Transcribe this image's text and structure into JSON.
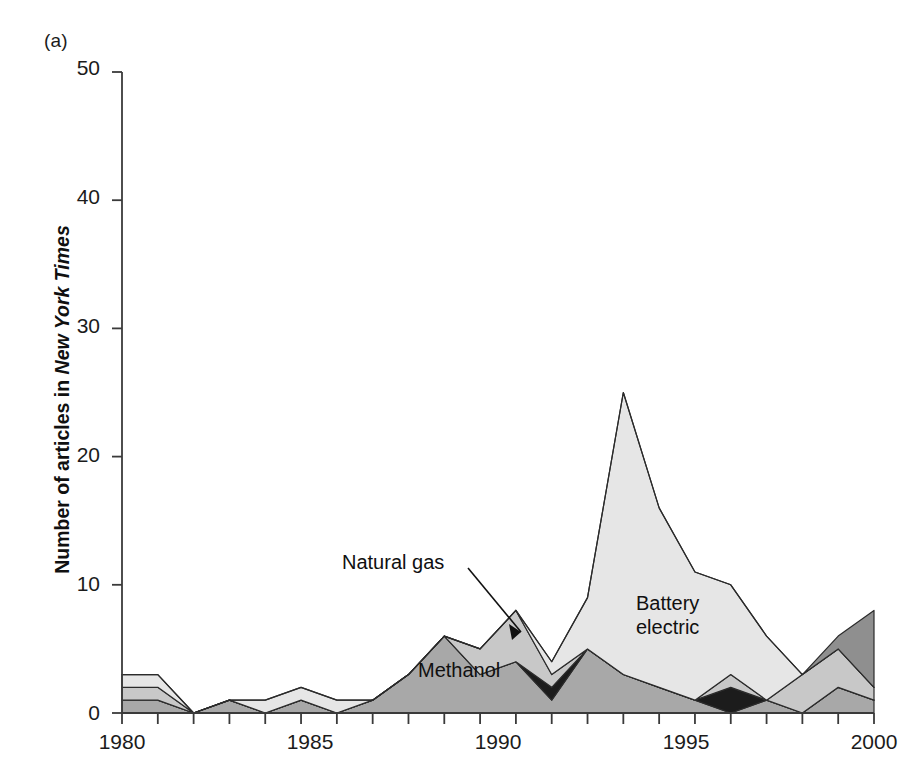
{
  "figure": {
    "panel_label": "(a)"
  },
  "axes": {
    "ylabel_prefix": "Number of articles in ",
    "ylabel_italic": "New York Times",
    "y_ticks": [
      "0",
      "10",
      "20",
      "30",
      "40",
      "50"
    ],
    "x_ticks": [
      "1980",
      "1985",
      "1990",
      "1995",
      "2000"
    ]
  },
  "annotations": {
    "natural_gas": "Natural gas",
    "battery_electric_line1": "Battery",
    "battery_electric_line2": "electric",
    "methanol": "Methanol"
  },
  "colors": {
    "methanol": "#a8a8a8",
    "hydrogen_dark": "#1c1c1c",
    "natural_gas": "#c8c8c8",
    "battery_electric": "#e6e6e6",
    "other_dark_gray": "#8f8f8f",
    "outline": "#2b2b2b",
    "axis": "#3a3a3a",
    "background": "#ffffff"
  },
  "chart_data": {
    "type": "area",
    "title": "",
    "subtitle": "",
    "xlabel": "",
    "ylabel": "Number of articles in New York Times",
    "xlim": [
      1980,
      2001
    ],
    "ylim": [
      0,
      50
    ],
    "grid": false,
    "stacked": true,
    "legend_position": "inline-annotations",
    "x": [
      1980,
      1981,
      1982,
      1983,
      1984,
      1985,
      1986,
      1987,
      1988,
      1989,
      1990,
      1991,
      1992,
      1993,
      1994,
      1995,
      1996,
      1997,
      1998,
      1999,
      2000,
      2001
    ],
    "categories": [
      "1980",
      "1981",
      "1982",
      "1983",
      "1984",
      "1985",
      "1986",
      "1987",
      "1988",
      "1989",
      "1990",
      "1991",
      "1992",
      "1993",
      "1994",
      "1995",
      "1996",
      "1997",
      "1998",
      "1999",
      "2000",
      "2001"
    ],
    "series": [
      {
        "name": "Methanol",
        "color": "#a8a8a8",
        "values": [
          1,
          1,
          0,
          1,
          0,
          1,
          0,
          1,
          3,
          6,
          3,
          4,
          1,
          5,
          3,
          2,
          1,
          0,
          1,
          0,
          2,
          1
        ]
      },
      {
        "name": "Hydrogen / fuel cell",
        "color": "#1c1c1c",
        "values": [
          0,
          0,
          0,
          0,
          0,
          0,
          0,
          0,
          0,
          0,
          0,
          0,
          1,
          0,
          0,
          0,
          0,
          2,
          0,
          0,
          0,
          0
        ]
      },
      {
        "name": "Natural gas",
        "color": "#c8c8c8",
        "values": [
          1,
          1,
          0,
          0,
          0,
          0,
          0,
          0,
          0,
          0,
          2,
          4,
          1,
          0,
          0,
          0,
          0,
          1,
          0,
          3,
          3,
          1
        ]
      },
      {
        "name": "Battery electric",
        "color": "#e6e6e6",
        "values": [
          1,
          1,
          0,
          0,
          1,
          1,
          1,
          0,
          0,
          0,
          0,
          0,
          1,
          4,
          22,
          14,
          10,
          7,
          5,
          0,
          0,
          0
        ]
      },
      {
        "name": "Other",
        "color": "#8f8f8f",
        "values": [
          0,
          0,
          0,
          0,
          0,
          0,
          0,
          0,
          0,
          0,
          0,
          0,
          0,
          0,
          0,
          0,
          0,
          0,
          0,
          0,
          1,
          6
        ]
      }
    ],
    "totals": [
      3,
      3,
      0,
      1,
      1,
      2,
      1,
      1,
      3,
      6,
      5,
      8,
      4,
      9,
      25,
      16,
      11,
      10,
      6,
      3,
      6,
      8
    ],
    "peak": {
      "year": 1994,
      "value": 25,
      "series": "Battery electric"
    }
  }
}
